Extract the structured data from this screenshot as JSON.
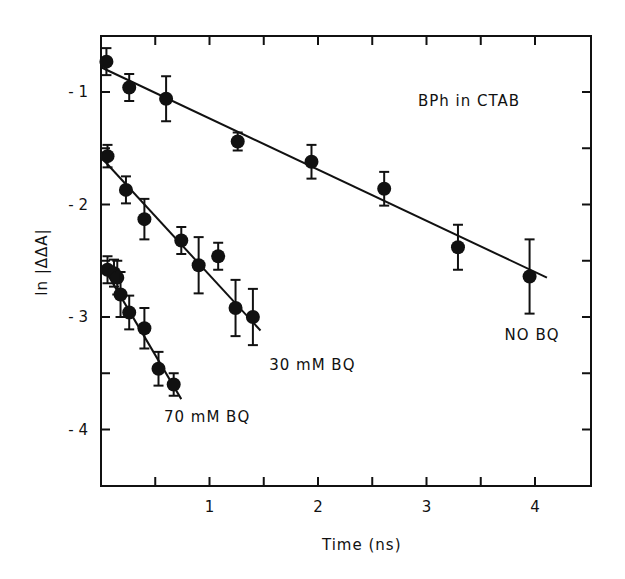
{
  "chart_data": {
    "type": "scatter",
    "title": "",
    "annotation": "BPh in CTAB",
    "xlabel": "Time (ns)",
    "ylabel": "ln |ΔΔA|",
    "xlim": [
      0,
      4.5
    ],
    "ylim": [
      -4.5,
      -0.6
    ],
    "xticks": [
      1,
      2,
      3,
      4
    ],
    "xtick_labels": [
      "1",
      "2",
      "3",
      "4"
    ],
    "xminor_ticks": [
      0.5,
      1,
      1.5,
      2,
      2.5,
      3,
      3.5,
      4
    ],
    "yticks": [
      -1,
      -2,
      -3,
      -4
    ],
    "ytick_labels": [
      "- 1",
      "- 2",
      "- 3",
      "- 4"
    ],
    "yminor_ticks": [
      -1,
      -1.5,
      -2,
      -2.5,
      -3,
      -3.5,
      -4
    ],
    "grid": false,
    "legend": "inline labels",
    "series": [
      {
        "name": "NO BQ",
        "x": [
          0.05,
          0.26,
          0.6,
          1.26,
          1.94,
          2.61,
          3.29,
          3.95
        ],
        "y": [
          -0.73,
          -0.96,
          -1.06,
          -1.44,
          -1.62,
          -1.86,
          -2.38,
          -2.64
        ],
        "err": [
          0.12,
          0.12,
          0.2,
          0.08,
          0.15,
          0.15,
          0.2,
          0.33
        ],
        "fit_line": {
          "x": [
            0.0,
            4.11
          ],
          "y": [
            -0.78,
            -2.65
          ]
        },
        "label_pos": {
          "x": 3.72,
          "y": -3.2
        }
      },
      {
        "name": "30 mM BQ",
        "x": [
          0.06,
          0.23,
          0.4,
          0.74,
          0.9,
          1.08,
          1.24,
          1.4
        ],
        "y": [
          -1.57,
          -1.87,
          -2.13,
          -2.32,
          -2.54,
          -2.46,
          -2.92,
          -3.0
        ],
        "err": [
          0.1,
          0.12,
          0.18,
          0.12,
          0.25,
          0.12,
          0.25,
          0.25
        ],
        "fit_line": {
          "x": [
            0.0,
            1.47
          ],
          "y": [
            -1.58,
            -3.12
          ]
        },
        "label_pos": {
          "x": 1.55,
          "y": -3.47
        }
      },
      {
        "name": "70 mM BQ",
        "x": [
          0.06,
          0.12,
          0.15,
          0.18,
          0.26,
          0.4,
          0.53,
          0.67
        ],
        "y": [
          -2.58,
          -2.61,
          -2.65,
          -2.8,
          -2.96,
          -3.1,
          -3.46,
          -3.6
        ],
        "err": [
          0.12,
          0.12,
          0.15,
          0.2,
          0.15,
          0.18,
          0.15,
          0.1
        ],
        "fit_line": {
          "x": [
            0.03,
            0.74
          ],
          "y": [
            -2.57,
            -3.73
          ]
        },
        "label_pos": {
          "x": 0.58,
          "y": -3.93
        }
      }
    ]
  }
}
